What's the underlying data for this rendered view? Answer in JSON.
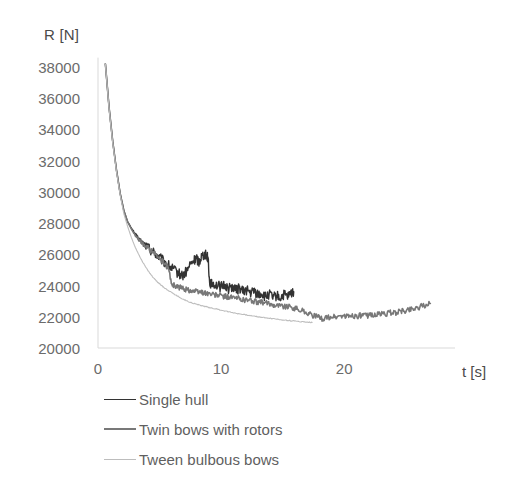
{
  "chart_data": {
    "type": "line",
    "title": "",
    "xlabel": "t [s]",
    "ylabel": "R [N]",
    "xlim": [
      0,
      29
    ],
    "ylim": [
      20000,
      38000
    ],
    "xticks": [
      0,
      10,
      20
    ],
    "xtick_labels": [
      "0",
      "10",
      "20"
    ],
    "yticks": [
      20000,
      22000,
      24000,
      26000,
      28000,
      30000,
      32000,
      34000,
      36000,
      38000
    ],
    "ytick_labels": [
      "20000",
      "22000",
      "24000",
      "26000",
      "28000",
      "30000",
      "32000",
      "34000",
      "36000",
      "38000"
    ],
    "grid": false,
    "legend_position": "below",
    "series": [
      {
        "name": "Single hull",
        "color": "#333333",
        "width": 1.4,
        "x": [
          0.6,
          0.9,
          1.2,
          1.5,
          1.8,
          2.1,
          2.4,
          2.7,
          3.0,
          3.3,
          3.6,
          3.9,
          4.2,
          4.5,
          4.8,
          5.1,
          5.4,
          5.7,
          6.0,
          6.3,
          6.6,
          6.9,
          7.2,
          7.5,
          7.8,
          8.0,
          8.2,
          8.4,
          8.6,
          8.8,
          8.95,
          9.05,
          9.2,
          9.4,
          9.7,
          10.0,
          10.3,
          10.6,
          10.9,
          11.2,
          11.5,
          11.8,
          12.1,
          12.4,
          12.7,
          13.0,
          13.3,
          13.6,
          13.9,
          14.2,
          14.5,
          14.8,
          15.1,
          15.4,
          15.7,
          15.9
        ],
        "y": [
          38200,
          35400,
          33200,
          31400,
          29900,
          28800,
          28100,
          27700,
          27300,
          27000,
          26750,
          26550,
          26350,
          26150,
          25950,
          25700,
          25500,
          25300,
          25100,
          24900,
          24750,
          24650,
          24900,
          25350,
          25600,
          25750,
          25500,
          25900,
          26000,
          25950,
          25800,
          24300,
          24050,
          24150,
          24000,
          23900,
          24050,
          23800,
          23950,
          23700,
          23850,
          23600,
          23750,
          23500,
          23650,
          23400,
          23500,
          23250,
          23450,
          23200,
          23350,
          23200,
          23400,
          23250,
          23500,
          23600
        ]
      },
      {
        "name": "Twin bows with rotors",
        "color": "#787878",
        "width": 1.6,
        "x": [
          0.6,
          0.9,
          1.2,
          1.5,
          1.8,
          2.1,
          2.4,
          2.7,
          3.0,
          3.3,
          3.6,
          3.9,
          4.2,
          4.5,
          4.8,
          5.1,
          5.4,
          5.7,
          6.0,
          6.3,
          6.6,
          6.9,
          7.2,
          7.5,
          7.8,
          8.1,
          8.4,
          8.7,
          9.0,
          9.4,
          9.8,
          10.2,
          10.6,
          11.0,
          11.4,
          11.8,
          12.2,
          12.6,
          13.0,
          13.4,
          13.8,
          14.2,
          14.6,
          15.0,
          15.4,
          15.8,
          16.2,
          16.6,
          17.0,
          17.4,
          17.8,
          18.2,
          18.6,
          19.0,
          19.4,
          19.8,
          20.2,
          20.6,
          21.0,
          21.4,
          21.8,
          22.2,
          22.6,
          23.0,
          23.4,
          23.8,
          24.2,
          24.6,
          25.0,
          25.4,
          25.8,
          26.2,
          26.6,
          27.0
        ],
        "y": [
          38200,
          35400,
          33200,
          31400,
          29900,
          28800,
          28100,
          27650,
          27250,
          26950,
          26700,
          26500,
          26300,
          26100,
          25900,
          25650,
          25400,
          25150,
          24100,
          23950,
          23880,
          23820,
          23750,
          23700,
          23650,
          23600,
          23580,
          23530,
          23480,
          23400,
          23380,
          23300,
          23280,
          23200,
          23180,
          23100,
          23080,
          23000,
          22950,
          22900,
          22850,
          22800,
          22750,
          22700,
          22650,
          22600,
          22500,
          22400,
          22250,
          22100,
          21980,
          21900,
          21920,
          22000,
          21980,
          22060,
          22000,
          22080,
          22020,
          22100,
          22050,
          22150,
          22100,
          22200,
          22180,
          22280,
          22250,
          22350,
          22400,
          22500,
          22560,
          22650,
          22720,
          22850
        ]
      },
      {
        "name": "Tween bulbous bows",
        "color": "#bdbdbd",
        "width": 1.1,
        "x": [
          0.6,
          0.9,
          1.2,
          1.5,
          1.8,
          2.1,
          2.4,
          2.7,
          3.0,
          3.3,
          3.6,
          3.9,
          4.2,
          4.5,
          4.8,
          5.1,
          5.4,
          5.7,
          6.0,
          6.4,
          6.8,
          7.2,
          7.6,
          8.0,
          8.4,
          8.8,
          9.2,
          9.6,
          10.0,
          10.5,
          11.0,
          11.5,
          12.0,
          12.5,
          13.0,
          13.5,
          14.0,
          14.5,
          15.0,
          15.5,
          16.0,
          16.5,
          17.0,
          17.4
        ],
        "y": [
          38200,
          35300,
          33100,
          31300,
          29800,
          28600,
          27800,
          27100,
          26500,
          26000,
          25550,
          25150,
          24800,
          24500,
          24250,
          24050,
          23850,
          23700,
          23550,
          23350,
          23180,
          23020,
          22900,
          22800,
          22720,
          22640,
          22570,
          22500,
          22430,
          22340,
          22260,
          22190,
          22120,
          22060,
          22000,
          21950,
          21900,
          21850,
          21800,
          21760,
          21720,
          21690,
          21660,
          21640
        ]
      }
    ],
    "annotations": [
      {
        "text": "spike in Single hull around t = 8-9 s peaking near 26000 N"
      }
    ]
  },
  "axes": {
    "y_title": "R [N]",
    "x_title": "t [s]"
  },
  "legend": {
    "items": [
      {
        "label": "Single hull",
        "color": "#333333",
        "width": "1.8px"
      },
      {
        "label": "Twin bows with rotors",
        "color": "#787878",
        "width": "2.2px"
      },
      {
        "label": "Tween bulbous bows",
        "color": "#bdbdbd",
        "width": "1.4px"
      }
    ]
  },
  "colors": {
    "axis_line": "#d9d9d9",
    "tick_text": "#6b6b6b",
    "background": "#ffffff"
  }
}
